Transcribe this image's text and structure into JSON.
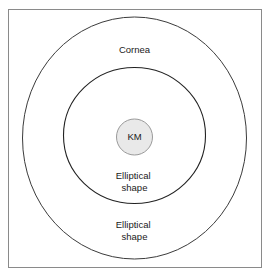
{
  "figure": {
    "background_color": "#ffffff",
    "frame": {
      "name": "outer-frame",
      "x": 8,
      "y": 9,
      "width": 254,
      "height": 259,
      "stroke_color": "#8a8a8a",
      "fill_color": "#ffffff",
      "stroke_width": 1
    },
    "shapes": [
      {
        "id": "outer-ellipse",
        "cx": 134.5,
        "cy": 138,
        "rx": 112,
        "ry": 121,
        "stroke_color": "#3b3b3b",
        "fill_color": "none",
        "stroke_width": 1
      },
      {
        "id": "middle-ellipse",
        "cx": 134.5,
        "cy": 135.5,
        "rx": 71,
        "ry": 68,
        "stroke_color": "#222222",
        "fill_color": "none",
        "stroke_width": 1.1
      },
      {
        "id": "km-circle",
        "cx": 134.5,
        "cy": 137,
        "rx": 18,
        "ry": 18,
        "stroke_color": "#9a9a9a",
        "fill_color": "#e9e9e9",
        "stroke_width": 1
      }
    ],
    "labels": [
      {
        "id": "cornea-label",
        "text": "Cornea",
        "lines": [
          "Cornea"
        ],
        "x": 134.5,
        "y": 50,
        "color": "#1a1a1a"
      },
      {
        "id": "km-label",
        "text": "KM",
        "lines": [
          "KM"
        ],
        "x": 134.5,
        "y": 137.5,
        "color": "#1a1a1a"
      },
      {
        "id": "inner-elliptical-shape-label",
        "text": "Elliptical shape",
        "lines": [
          "Elliptical",
          "shape"
        ],
        "x": 134.5,
        "y": 176,
        "color": "#1a1a1a"
      },
      {
        "id": "outer-elliptical-shape-label",
        "text": "Elliptical shape",
        "lines": [
          "Elliptical",
          "shape"
        ],
        "x": 134.5,
        "y": 225,
        "color": "#1a1a1a"
      }
    ]
  }
}
